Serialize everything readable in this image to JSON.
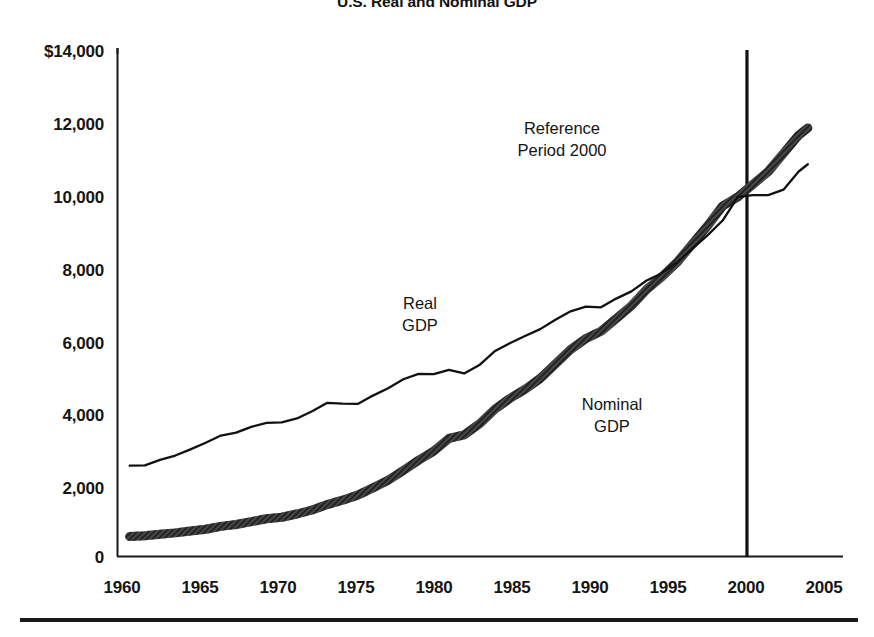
{
  "chart_data": {
    "type": "line",
    "title": "U.S. Real and Nominal GDP",
    "xlabel": "",
    "ylabel": "",
    "xlim": [
      1959.2,
      2005.6
    ],
    "ylim": [
      0,
      14000
    ],
    "grid": false,
    "legend_position": "inline-annotations",
    "xticks": [
      "1960",
      "1965",
      "1970",
      "1975",
      "1980",
      "1985",
      "1990",
      "1995",
      "2000",
      "2005"
    ],
    "xtick_values": [
      1960,
      1965,
      1970,
      1975,
      1980,
      1985,
      1990,
      1995,
      2000,
      2005
    ],
    "yticks": [
      "0",
      "2,000",
      "4,000",
      "6,000",
      "8,000",
      "10,000",
      "12,000",
      "$14,000"
    ],
    "ytick_values": [
      0,
      2000,
      4000,
      6000,
      8000,
      10000,
      12000,
      14000
    ],
    "units": "Billions of dollars",
    "annotations": [
      {
        "name": "reference-period",
        "line1": "Reference",
        "line2": "Period 2000",
        "x": 1987.5,
        "y": 11300
      },
      {
        "name": "real-gdp-label",
        "line1": "Real",
        "line2": "GDP",
        "x": 1978.0,
        "y": 7050
      },
      {
        "name": "nominal-gdp-label",
        "line1": "Nominal",
        "line2": "GDP",
        "x": 1988.5,
        "y": 3950
      }
    ],
    "reference_line": {
      "name": "reference-period-2000-line",
      "x": 2000.6,
      "y_from": 0,
      "y_to": 14000
    },
    "series": [
      {
        "name": "Real GDP",
        "style": "thin-solid-black",
        "color": "#111111",
        "x": [
          1960,
          1961,
          1962,
          1963,
          1964,
          1965,
          1966,
          1967,
          1968,
          1969,
          1970,
          1971,
          1972,
          1973,
          1974,
          1975,
          1976,
          1977,
          1978,
          1979,
          1980,
          1981,
          1982,
          1983,
          1984,
          1985,
          1986,
          1987,
          1988,
          1989,
          1990,
          1991,
          1992,
          1993,
          1994,
          1995,
          1996,
          1997,
          1998,
          1999,
          2000,
          2001,
          2002,
          2003,
          2004,
          2004.6
        ],
        "values": [
          2500,
          2510,
          2660,
          2780,
          2950,
          3130,
          3330,
          3410,
          3570,
          3680,
          3690,
          3800,
          4000,
          4230,
          4210,
          4200,
          4430,
          4630,
          4880,
          5030,
          5020,
          5140,
          5040,
          5270,
          5650,
          5870,
          6070,
          6260,
          6520,
          6750,
          6880,
          6860,
          7100,
          7300,
          7600,
          7800,
          8100,
          8470,
          8840,
          9250,
          9900,
          9950,
          9950,
          10100,
          10600,
          10800
        ]
      },
      {
        "name": "Nominal GDP",
        "style": "thick-hatched-gray",
        "color": "#4a4a4a",
        "x": [
          1960,
          1961,
          1962,
          1963,
          1964,
          1965,
          1966,
          1967,
          1968,
          1969,
          1970,
          1971,
          1972,
          1973,
          1974,
          1975,
          1976,
          1977,
          1978,
          1979,
          1980,
          1981,
          1982,
          1983,
          1984,
          1985,
          1986,
          1987,
          1988,
          1989,
          1990,
          1991,
          1992,
          1993,
          1994,
          1995,
          1996,
          1997,
          1998,
          1999,
          2000,
          2001,
          2002,
          2003,
          2004,
          2004.6
        ],
        "values": [
          550,
          570,
          610,
          650,
          700,
          750,
          830,
          880,
          960,
          1040,
          1080,
          1170,
          1280,
          1430,
          1550,
          1690,
          1890,
          2100,
          2370,
          2650,
          2900,
          3250,
          3350,
          3650,
          4050,
          4350,
          4600,
          4900,
          5300,
          5700,
          6000,
          6200,
          6550,
          6900,
          7350,
          7700,
          8100,
          8600,
          9100,
          9650,
          9900,
          10250,
          10600,
          11100,
          11600,
          11800
        ]
      }
    ]
  },
  "figure": {
    "footer_rule": "horizontal-rule"
  }
}
